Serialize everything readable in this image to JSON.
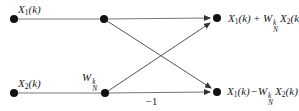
{
  "labels": {
    "x1": {
      "base": "X",
      "sub": "1",
      "arg": "(k)"
    },
    "x2": {
      "base": "X",
      "sub": "2",
      "arg": "(k)"
    },
    "w": {
      "base": "W",
      "sup": "k",
      "sub": "N"
    },
    "out_top": {
      "x1": "X",
      "x1sub": "1",
      "x1arg": "(k)",
      "op": "+",
      "w": "W",
      "wsup": "k",
      "wsub": "N",
      "x2": "X",
      "x2sub": "2",
      "x2arg": "(k)"
    },
    "out_bottom": {
      "x1": "X",
      "x1sub": "1",
      "x1arg": "(k)",
      "op": "−",
      "w": "W",
      "wsup": "k",
      "wsub": "N",
      "x2": "X",
      "x2sub": "2",
      "x2arg": "(k)"
    },
    "gain": "−1"
  },
  "colors": {
    "wire": "#777777",
    "diagonal": "#555555",
    "node": "#111111",
    "text": "#1a1a1a"
  }
}
